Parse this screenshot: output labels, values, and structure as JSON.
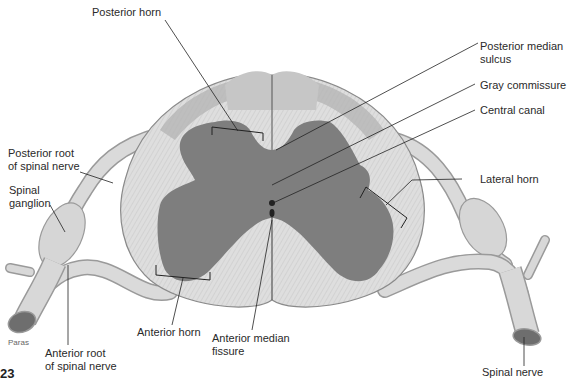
{
  "diagram": {
    "colors": {
      "background": "#ffffff",
      "white_matter": "#dcdcdc",
      "white_matter_striation": "#c4c4c4",
      "gray_matter": "#7e7e7e",
      "dorsal_columns": "#b9b9b9",
      "nerve": "#d9d9d9",
      "nerve_outline": "#9a9a9a",
      "leader_line": "#222222",
      "text": "#2a2a2a"
    },
    "labels": {
      "posterior_horn": "Posterior horn",
      "posterior_median_sulcus": "Posterior median\nsulcus",
      "gray_commissure": "Gray commissure",
      "central_canal": "Central canal",
      "posterior_root": "Posterior root\nof spinal nerve",
      "spinal_ganglion": "Spinal\nganglion",
      "lateral_horn": "Lateral horn",
      "anterior_horn": "Anterior horn",
      "anterior_median_fissure": "Anterior median\nfissure",
      "anterior_root": "Anterior root\nof spinal nerve",
      "spinal_nerve": "Spinal nerve"
    },
    "credit": "Paras",
    "figure_number_fragment": "23"
  }
}
